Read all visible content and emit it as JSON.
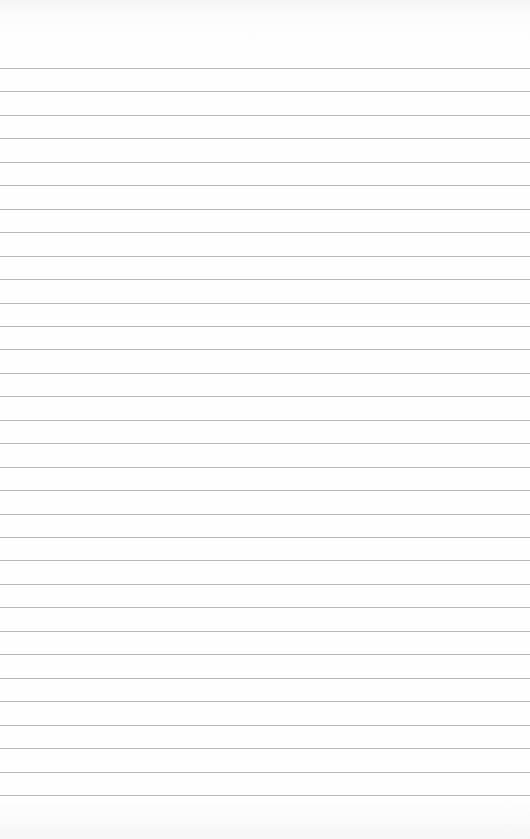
{
  "page": {
    "type": "ruled-paper",
    "background_color": "#fdfdfd",
    "line_color": "#a9a9a9",
    "line_count": 32,
    "first_line_y": 68,
    "line_spacing": 23.45,
    "text": ""
  }
}
